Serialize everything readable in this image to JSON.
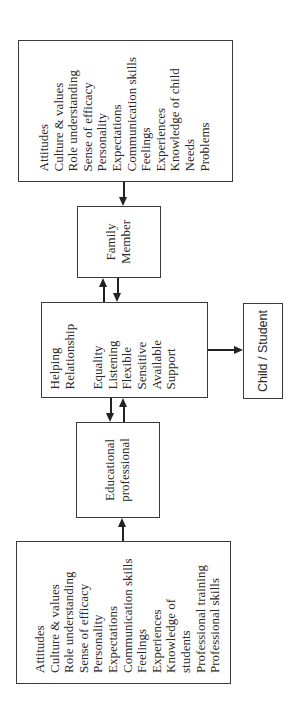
{
  "diagram": {
    "family_attributes": {
      "items": [
        "Attitudes",
        "Culture & values",
        "Role understanding",
        "Sense of efficacy",
        "Personality",
        "Expectations",
        "Communication skills",
        "Feelings",
        "Experiences",
        "Knowledge of child",
        "Needs",
        "Problems"
      ]
    },
    "family_member": {
      "lines": [
        "Family",
        "Member"
      ]
    },
    "helping_relationship": {
      "title_lines": [
        "Helping",
        "Relationship"
      ],
      "qualities": [
        "Equality",
        "Listening",
        "Flexible",
        "Sensitive",
        "Available",
        "Support"
      ]
    },
    "child_student": {
      "label": "Child / Student"
    },
    "educational_professional": {
      "lines": [
        "Educational",
        "professional"
      ]
    },
    "professional_attributes": {
      "items": [
        "Attitudes",
        "Culture & values",
        "Role understanding",
        "Sense of efficacy",
        "Personality",
        "Expectations",
        "Communication skills",
        "Feelings",
        "Experiences",
        "Knowledge of",
        "students",
        "Professional training",
        "Professional skills"
      ]
    },
    "colors": {
      "line": "#222222",
      "border": "#3a3a3a",
      "text": "#2a2a2a",
      "background": "#ffffff"
    }
  }
}
